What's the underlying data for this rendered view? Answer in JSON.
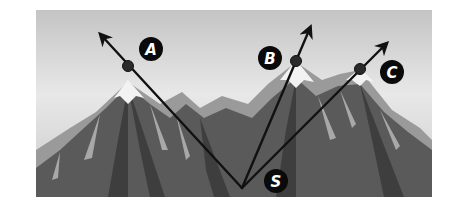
{
  "diagram": {
    "type": "rays-from-vertex",
    "frame": {
      "x": 36,
      "y": 10,
      "width": 396,
      "height": 187
    },
    "colors": {
      "sky_top": "#c9c9c9",
      "sky_mid": "#e6e6e6",
      "sky_low": "#d8d8d8",
      "mountain_dark": "#4a4a4a",
      "mountain_mid": "#6e6e6e",
      "mountain_light": "#9a9a9a",
      "snow": "#f2f2f2",
      "ray": "#111111",
      "point": "#2b2b2b",
      "label_bg": "#0a0a0a",
      "label_fg": "#ffffff"
    },
    "vertex": {
      "name": "S",
      "x": 242,
      "y": 188
    },
    "rays": [
      {
        "name": "A",
        "point": {
          "x": 128,
          "y": 66
        },
        "tip": {
          "x": 101,
          "y": 35
        },
        "label": {
          "text": "A",
          "x": 151,
          "y": 49
        }
      },
      {
        "name": "B",
        "point": {
          "x": 296,
          "y": 61
        },
        "tip": {
          "x": 310,
          "y": 28
        },
        "label": {
          "text": "B",
          "x": 270,
          "y": 58
        }
      },
      {
        "name": "C",
        "point": {
          "x": 360,
          "y": 69
        },
        "tip": {
          "x": 386,
          "y": 44
        },
        "label": {
          "text": "C",
          "x": 392,
          "y": 72
        }
      }
    ],
    "vertex_label": {
      "text": "S",
      "x": 276,
      "y": 181
    }
  }
}
